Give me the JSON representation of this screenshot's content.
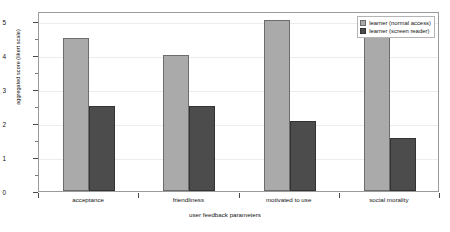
{
  "chart_data": {
    "type": "bar",
    "title": "",
    "subtitle": "",
    "xlabel": "user feedback parameters",
    "ylabel": "aggregated score (likert scale)",
    "categories": [
      "acceptance",
      "friendliness",
      "motivated to use",
      "social morality"
    ],
    "series": [
      {
        "name": "learner (normal access)",
        "color": "#aaaaaa",
        "values": [
          4.5,
          4.0,
          5.05,
          4.55
        ]
      },
      {
        "name": "learner (screen reader)",
        "color": "#4c4c4c",
        "values": [
          2.5,
          2.5,
          2.05,
          1.55
        ]
      }
    ],
    "ylim": [
      0,
      5.3
    ],
    "y_ticks": [
      0,
      1,
      2,
      3,
      4,
      5
    ],
    "y_tick_labels": [
      "0",
      "1",
      "2",
      "3",
      "4",
      "5"
    ],
    "y_minor_ticks": [
      0.5,
      1.5,
      2.5,
      3.5,
      4.5
    ],
    "grid": true,
    "grid_axis": "y",
    "legend_position": "top-right",
    "orientation": "vertical"
  },
  "figure": {
    "background": "#ffffff",
    "frame_color": "#9a9a9a",
    "grid_color": "#ececec"
  }
}
